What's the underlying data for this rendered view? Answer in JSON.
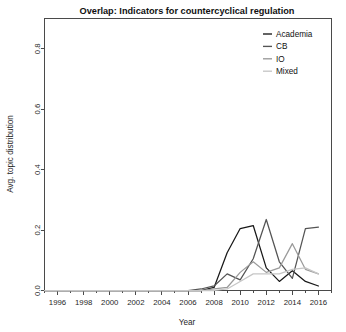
{
  "chart_data": {
    "type": "line",
    "title": "Overlap: Indicators for countercyclical regulation",
    "xlabel": "Year",
    "ylabel": "Avg. topic distribution",
    "xlim": [
      1995,
      2017
    ],
    "ylim": [
      0.0,
      0.9
    ],
    "xticks": [
      1996,
      1998,
      2000,
      2002,
      2004,
      2006,
      2008,
      2010,
      2012,
      2014,
      2016
    ],
    "xtick_labels": [
      "1996",
      "1998",
      "2000",
      "2002",
      "2004",
      "2006",
      "2008",
      "2010",
      "2012",
      "2014",
      "2016"
    ],
    "yticks": [
      0.0,
      0.2,
      0.4,
      0.6,
      0.8
    ],
    "ytick_labels": [
      "0.0",
      "0.2",
      "0.4",
      "0.6",
      "0.8"
    ],
    "minor_xticks": [
      1995,
      1997,
      1999,
      2001,
      2003,
      2005,
      2007,
      2009,
      2011,
      2013,
      2015,
      2017
    ],
    "grid": false,
    "legend_position": "top-right",
    "x": [
      1995,
      1996,
      1997,
      1998,
      1999,
      2000,
      2001,
      2002,
      2003,
      2004,
      2005,
      2006,
      2007,
      2008,
      2009,
      2010,
      2011,
      2012,
      2013,
      2014,
      2015,
      2016
    ],
    "series": [
      {
        "name": "Academia",
        "color": "#181818",
        "values": [
          0.0,
          0.0,
          0.0,
          0.0,
          0.0,
          0.0,
          0.0,
          0.0,
          0.0,
          0.0,
          0.0,
          0.0,
          0.0,
          0.01,
          0.125,
          0.205,
          0.215,
          0.075,
          0.03,
          0.065,
          0.03,
          0.015
        ]
      },
      {
        "name": "CB",
        "color": "#545454",
        "values": [
          0.0,
          0.0,
          0.0,
          0.0,
          0.0,
          0.0,
          0.0,
          0.0,
          0.0,
          0.0,
          0.0,
          0.0,
          0.005,
          0.015,
          0.055,
          0.035,
          0.105,
          0.235,
          0.095,
          0.04,
          0.205,
          0.21
        ]
      },
      {
        "name": "IO",
        "color": "#9a9a9a",
        "values": [
          0.0,
          0.0,
          0.0,
          0.0,
          0.0,
          0.0,
          0.0,
          0.0,
          0.0,
          0.0,
          0.0,
          0.0,
          0.0,
          0.005,
          0.01,
          0.06,
          0.095,
          0.06,
          0.075,
          0.155,
          0.07,
          0.055
        ]
      },
      {
        "name": "Mixed",
        "color": "#c6c6c6",
        "values": [
          0.0,
          0.0,
          0.0,
          0.0,
          0.0,
          0.0,
          0.0,
          0.0,
          0.0,
          0.0,
          0.0,
          0.0,
          0.0,
          0.0,
          0.005,
          0.03,
          0.055,
          0.055,
          0.055,
          0.07,
          0.075,
          0.055
        ]
      }
    ]
  },
  "legend": {
    "entries": [
      {
        "label": "Academia"
      },
      {
        "label": "CB"
      },
      {
        "label": "IO"
      },
      {
        "label": "Mixed"
      }
    ]
  }
}
